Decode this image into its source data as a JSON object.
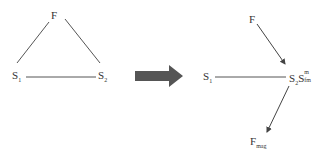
{
  "left_diagram": {
    "nodes": [
      {
        "id": "F",
        "label": "F",
        "sub": ""
      },
      {
        "id": "S1",
        "label": "S",
        "sub": "1"
      },
      {
        "id": "S2",
        "label": "S",
        "sub": "2"
      }
    ],
    "edges": [
      {
        "from": "F",
        "to": "S1"
      },
      {
        "from": "F",
        "to": "S2"
      },
      {
        "from": "S1",
        "to": "S2"
      }
    ]
  },
  "transition_arrow": {
    "color": "#555555",
    "direction": "right"
  },
  "right_diagram": {
    "nodes": [
      {
        "id": "F",
        "label": "F",
        "sub": ""
      },
      {
        "id": "S1",
        "label": "S",
        "sub": "1"
      },
      {
        "id": "S2Sfm",
        "label": "S",
        "sub": "2",
        "label2": "S",
        "sup2": "m",
        "sub2": "fm"
      },
      {
        "id": "Fmag",
        "label": "F",
        "sub": "mag"
      }
    ],
    "edges": [
      {
        "from": "F",
        "to": "S2Sfm",
        "type": "arrow"
      },
      {
        "from": "S1",
        "to": "S2Sfm",
        "type": "line"
      },
      {
        "from": "S2Sfm",
        "to": "Fmag",
        "type": "arrow"
      }
    ]
  }
}
